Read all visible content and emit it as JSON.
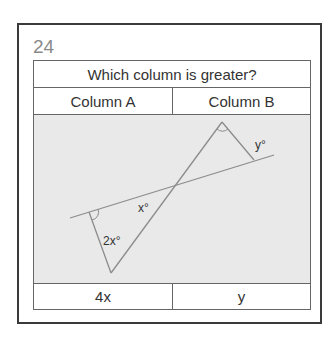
{
  "question": {
    "number": "24",
    "prompt": "Which column is greater?",
    "columns": [
      {
        "header": "Column A",
        "value": "4x"
      },
      {
        "header": "Column B",
        "value": "y"
      }
    ]
  },
  "figure": {
    "labels": {
      "x_angle": "x°",
      "two_x_angle": "2x°",
      "y_angle": "y°"
    },
    "colors": {
      "background": "#e9e9e9",
      "line": "#8c8c8c"
    }
  }
}
